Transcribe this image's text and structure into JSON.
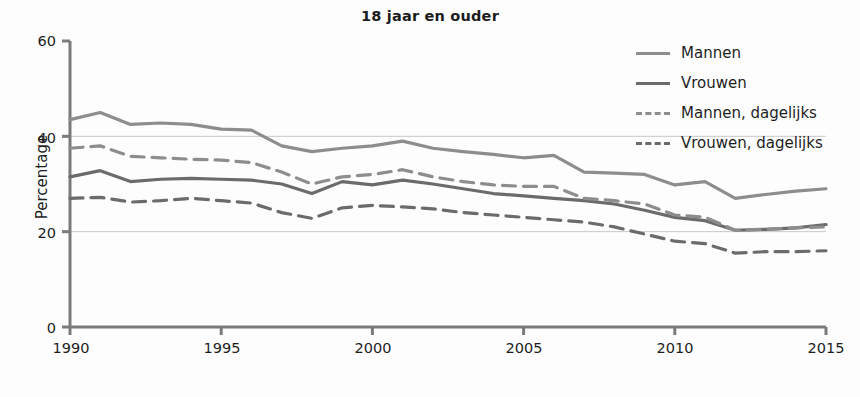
{
  "chart_data": {
    "type": "line",
    "title": "18 jaar en ouder",
    "xlabel": "",
    "ylabel": "Percentage",
    "xlim": [
      1990,
      2015
    ],
    "ylim": [
      0,
      60
    ],
    "yticks": [
      0,
      20,
      40,
      60
    ],
    "xticks": [
      1990,
      1995,
      2000,
      2005,
      2010,
      2015
    ],
    "grid": "horizontal gridlines at 20 and 40",
    "legend_position": "top-right",
    "x": [
      1990,
      1991,
      1992,
      1993,
      1994,
      1995,
      1996,
      1997,
      1998,
      1999,
      2000,
      2001,
      2002,
      2003,
      2004,
      2005,
      2006,
      2007,
      2008,
      2009,
      2010,
      2011,
      2012,
      2013,
      2014,
      2015
    ],
    "series": [
      {
        "name": "Mannen",
        "style": "solid",
        "color": "#8d8d8d",
        "values": [
          43.5,
          45.0,
          42.5,
          42.8,
          42.5,
          41.5,
          41.3,
          38.0,
          36.8,
          37.5,
          38.0,
          39.0,
          37.5,
          36.8,
          36.2,
          35.5,
          36.0,
          32.5,
          32.3,
          32.0,
          29.8,
          30.5,
          27.0,
          27.8,
          28.5,
          29.0
        ]
      },
      {
        "name": "Vrouwen",
        "style": "solid",
        "color": "#6b6b6b",
        "values": [
          31.5,
          32.8,
          30.5,
          31.0,
          31.2,
          31.0,
          30.8,
          30.0,
          28.0,
          30.5,
          29.8,
          30.8,
          30.0,
          29.0,
          28.0,
          27.5,
          27.0,
          26.5,
          25.8,
          24.5,
          23.0,
          22.3,
          20.3,
          20.5,
          20.8,
          21.5
        ]
      },
      {
        "name": "Mannen, dagelijks",
        "style": "dashed",
        "color": "#8d8d8d",
        "values": [
          37.5,
          38.0,
          35.8,
          35.5,
          35.2,
          35.0,
          34.5,
          32.5,
          30.0,
          31.5,
          32.0,
          33.0,
          31.5,
          30.5,
          29.8,
          29.5,
          29.5,
          27.0,
          26.5,
          25.8,
          23.5,
          23.0,
          20.3,
          20.5,
          20.8,
          21.0
        ]
      },
      {
        "name": "Vrouwen, dagelijks",
        "style": "dashed",
        "color": "#6b6b6b",
        "values": [
          27.0,
          27.2,
          26.2,
          26.5,
          27.0,
          26.5,
          26.0,
          24.0,
          22.8,
          25.0,
          25.5,
          25.2,
          24.8,
          24.0,
          23.5,
          23.0,
          22.5,
          22.0,
          21.0,
          19.5,
          18.0,
          17.5,
          15.5,
          15.8,
          15.8,
          16.0
        ]
      }
    ]
  },
  "legend": {
    "items": [
      {
        "label": "Mannen"
      },
      {
        "label": "Vrouwen"
      },
      {
        "label": "Mannen, dagelijks"
      },
      {
        "label": "Vrouwen, dagelijks"
      }
    ]
  },
  "axes": {
    "ylabel": "Percentage",
    "ytick_labels": [
      "60",
      "40",
      "20",
      "0"
    ],
    "xtick_labels": [
      "1990",
      "1995",
      "2000",
      "2005",
      "2010",
      "2015"
    ]
  },
  "colors": {
    "light": "#8d8d8d",
    "dark": "#6b6b6b",
    "axis": "#7a7a7a",
    "grid": "#c8c8c8",
    "text": "#1d1d1d",
    "background": "#fdfdfd"
  }
}
